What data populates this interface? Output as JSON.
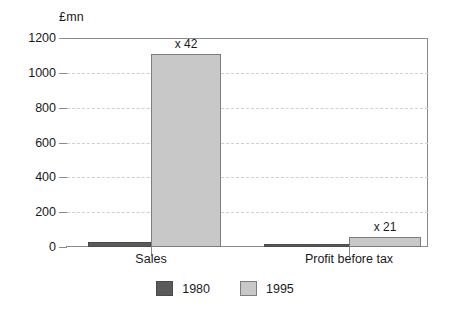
{
  "chart_data": {
    "type": "bar",
    "title": "",
    "subtitle": "",
    "xlabel": "",
    "ylabel": "£mn",
    "unit_label": "£mn",
    "categories": [
      "Sales",
      "Profit before tax"
    ],
    "series": [
      {
        "name": "1980",
        "color": "#5a5a5a",
        "values": [
          26,
          3
        ]
      },
      {
        "name": "1995",
        "color": "#c8c8c8",
        "values": [
          1110,
          60
        ]
      }
    ],
    "annotations": [
      {
        "text": "x 42",
        "category": "Sales",
        "series": "1995"
      },
      {
        "text": "x 21",
        "category": "Profit before tax",
        "series": "1995"
      }
    ],
    "ylim": [
      0,
      1200
    ],
    "ytick_labels": [
      "1200",
      "1000",
      "800",
      "600",
      "400",
      "200",
      "0"
    ],
    "ytick_values": [
      1200,
      1000,
      800,
      600,
      400,
      200,
      0
    ],
    "grid": true,
    "grid_style": "dashed",
    "legend_position": "bottom-center",
    "legend": [
      "1980",
      "1995"
    ]
  }
}
